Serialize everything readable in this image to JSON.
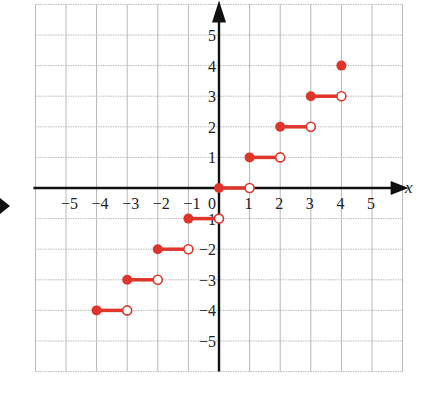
{
  "chart_data": {
    "type": "scatter",
    "subtype": "step-function",
    "title": "",
    "xlabel": "x",
    "ylabel": "",
    "xlim": [
      -6,
      6
    ],
    "ylim": [
      -6,
      6
    ],
    "grid": true,
    "x_ticks": [
      -5,
      -4,
      -3,
      -2,
      -1,
      0,
      1,
      2,
      3,
      4,
      5
    ],
    "x_tick_labels": [
      "−5",
      "−4",
      "−3",
      "−2",
      "−1",
      "0",
      "1",
      "2",
      "3",
      "4",
      "5"
    ],
    "y_ticks": [
      5,
      4,
      3,
      2,
      1,
      -1,
      -2,
      -3,
      -4,
      -5
    ],
    "y_tick_labels": [
      "5",
      "4",
      "3",
      "2",
      "1",
      "−1",
      "−2",
      "−3",
      "−4",
      "−5"
    ],
    "color": "#e0352b",
    "segments": [
      {
        "x_start": -4,
        "x_end": -3,
        "y": -4,
        "start": "closed",
        "end": "open"
      },
      {
        "x_start": -3,
        "x_end": -2,
        "y": -3,
        "start": "closed",
        "end": "open"
      },
      {
        "x_start": -2,
        "x_end": -1,
        "y": -2,
        "start": "closed",
        "end": "open"
      },
      {
        "x_start": -1,
        "x_end": 0,
        "y": -1,
        "start": "closed",
        "end": "open"
      },
      {
        "x_start": 0,
        "x_end": 1,
        "y": 0,
        "start": "closed",
        "end": "open"
      },
      {
        "x_start": 1,
        "x_end": 2,
        "y": 1,
        "start": "closed",
        "end": "open"
      },
      {
        "x_start": 2,
        "x_end": 3,
        "y": 2,
        "start": "closed",
        "end": "open"
      },
      {
        "x_start": 3,
        "x_end": 4,
        "y": 3,
        "start": "closed",
        "end": "open"
      }
    ],
    "points": [
      {
        "x": 4,
        "y": 4,
        "type": "closed"
      }
    ]
  }
}
